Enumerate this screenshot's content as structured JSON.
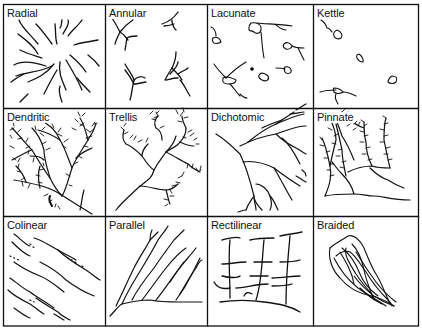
{
  "figure": {
    "type": "drainage-pattern-grid",
    "rows": 3,
    "columns": 4,
    "panels": [
      {
        "row": 0,
        "col": 0,
        "label": "Radial"
      },
      {
        "row": 0,
        "col": 1,
        "label": "Annular"
      },
      {
        "row": 0,
        "col": 2,
        "label": "Lacunate"
      },
      {
        "row": 0,
        "col": 3,
        "label": "Kettle"
      },
      {
        "row": 1,
        "col": 0,
        "label": "Dendritic"
      },
      {
        "row": 1,
        "col": 1,
        "label": "Trellis"
      },
      {
        "row": 1,
        "col": 2,
        "label": "Dichotomic"
      },
      {
        "row": 1,
        "col": 3,
        "label": "Pinnate"
      },
      {
        "row": 2,
        "col": 0,
        "label": "Colinear"
      },
      {
        "row": 2,
        "col": 1,
        "label": "Parallel"
      },
      {
        "row": 2,
        "col": 2,
        "label": "Rectilinear"
      },
      {
        "row": 2,
        "col": 3,
        "label": "Braided"
      }
    ],
    "colors": {
      "stroke": "#111111",
      "background": "#ffffff"
    }
  }
}
